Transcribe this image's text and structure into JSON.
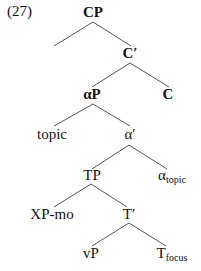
{
  "example_number": "(27)",
  "nodes": {
    "cp": "CP",
    "c_bar": "C′",
    "c": "C",
    "alpha_p": "αP",
    "topic": "topic",
    "alpha_bar": "α′",
    "alpha_topic": {
      "base": "α",
      "sub": "topic"
    },
    "tp": "TP",
    "xp_mo": "XP-mo",
    "t_bar": "T′",
    "vp": "vP",
    "t_focus": {
      "base": "T",
      "sub": "focus"
    }
  },
  "edges": [
    [
      "CP",
      "(empty)"
    ],
    [
      "CP",
      "C′"
    ],
    [
      "C′",
      "αP"
    ],
    [
      "C′",
      "C"
    ],
    [
      "αP",
      "topic"
    ],
    [
      "αP",
      "α′"
    ],
    [
      "α′",
      "TP"
    ],
    [
      "α′",
      "α_topic"
    ],
    [
      "TP",
      "XP-mo"
    ],
    [
      "TP",
      "T′"
    ],
    [
      "T′",
      "vP"
    ],
    [
      "T′",
      "T_focus"
    ]
  ]
}
